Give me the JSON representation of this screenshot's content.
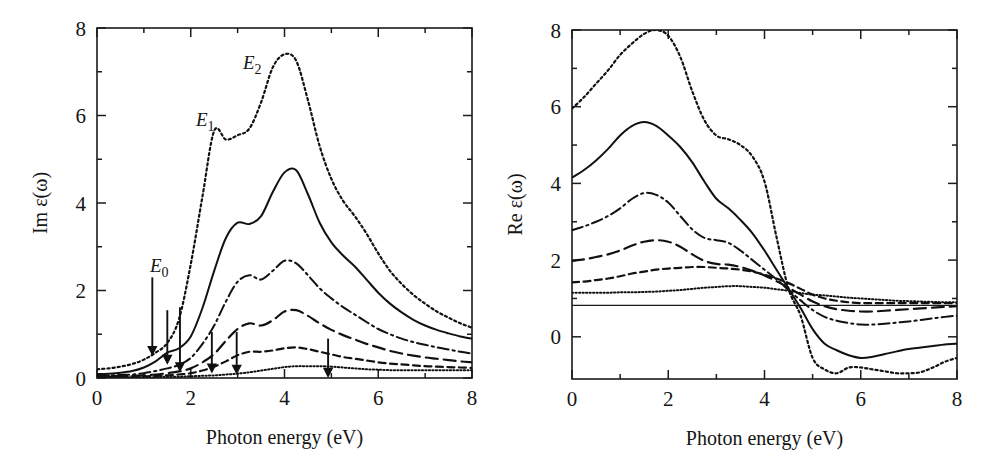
{
  "figure": {
    "panels": [
      {
        "id": "left",
        "ylabel": "Im ε(ω)",
        "xlabel": "Photon energy (eV)",
        "xticks": [
          "0",
          "2",
          "4",
          "6",
          "8"
        ],
        "yticks": [
          "0",
          "2",
          "4",
          "6",
          "8"
        ],
        "annotations": [
          {
            "name": "E0",
            "base": "E",
            "sub": "0",
            "x": 150,
            "y": 272
          },
          {
            "name": "E1",
            "base": "E",
            "sub": "1",
            "x": 196,
            "y": 126
          },
          {
            "name": "E2",
            "base": "E",
            "sub": "2",
            "x": 243,
            "y": 69
          }
        ]
      },
      {
        "id": "right",
        "ylabel": "Re ε(ω)",
        "xlabel": "Photon energy (eV)",
        "xticks": [
          "0",
          "2",
          "4",
          "6",
          "8"
        ],
        "yticks": [
          "0",
          "2",
          "4",
          "6",
          "8"
        ]
      }
    ]
  },
  "chart_data": [
    {
      "type": "line",
      "id": "imaginary-dielectric-function",
      "title": "",
      "xlabel": "Photon energy (eV)",
      "ylabel": "Im ε(ω)",
      "xlim": [
        0,
        8
      ],
      "ylim": [
        0,
        8
      ],
      "xticks": [
        0,
        2,
        4,
        6,
        8
      ],
      "yticks": [
        0,
        2,
        4,
        6,
        8
      ],
      "minor_xticks": [
        1,
        3,
        5,
        7
      ],
      "minor_yticks": [
        1,
        3,
        5,
        7
      ],
      "grid": false,
      "legend": "none",
      "annotations": [
        {
          "label": "E0",
          "text": "E₀"
        },
        {
          "label": "E1",
          "text": "E₁"
        },
        {
          "label": "E2",
          "text": "E₂"
        }
      ],
      "arrows": [
        {
          "x": 1.18,
          "y_top": 2.3,
          "y_tip": 0.55,
          "label": "E0"
        },
        {
          "x": 1.5,
          "y_top": 1.55,
          "y_tip": 0.35,
          "label": ""
        },
        {
          "x": 1.77,
          "y_top": 1.62,
          "y_tip": 0.18,
          "label": ""
        },
        {
          "x": 2.45,
          "y_top": 1.05,
          "y_tip": 0.15,
          "label": ""
        },
        {
          "x": 2.98,
          "y_top": 1.05,
          "y_tip": 0.12,
          "label": ""
        },
        {
          "x": 4.93,
          "y_top": 0.9,
          "y_tip": 0.05,
          "label": ""
        }
      ],
      "x": [
        0.0,
        0.25,
        0.5,
        0.75,
        1.0,
        1.25,
        1.5,
        1.75,
        2.0,
        2.25,
        2.5,
        2.75,
        3.0,
        3.25,
        3.5,
        3.75,
        4.0,
        4.25,
        4.5,
        4.75,
        5.0,
        5.25,
        5.5,
        5.75,
        6.0,
        6.25,
        6.5,
        6.75,
        7.0,
        7.25,
        7.5,
        7.75,
        8.0
      ],
      "series": [
        {
          "name": "curve-1-dotted-coarse",
          "style": "dotted",
          "values": [
            0.2,
            0.22,
            0.26,
            0.32,
            0.42,
            0.58,
            0.8,
            1.35,
            2.6,
            4.15,
            5.65,
            5.45,
            5.55,
            5.7,
            6.3,
            7.1,
            7.4,
            7.25,
            6.35,
            5.3,
            4.55,
            4.05,
            3.7,
            3.3,
            2.85,
            2.45,
            2.15,
            1.9,
            1.7,
            1.52,
            1.38,
            1.25,
            1.15
          ]
        },
        {
          "name": "curve-2-solid",
          "style": "solid",
          "values": [
            0.09,
            0.1,
            0.12,
            0.16,
            0.24,
            0.38,
            0.58,
            0.68,
            0.95,
            1.6,
            2.45,
            3.2,
            3.55,
            3.52,
            3.7,
            4.25,
            4.7,
            4.75,
            4.2,
            3.55,
            3.1,
            2.8,
            2.55,
            2.25,
            1.95,
            1.7,
            1.5,
            1.33,
            1.2,
            1.1,
            1.02,
            0.95,
            0.9
          ]
        },
        {
          "name": "curve-3-dash-dot",
          "style": "dash-dot",
          "values": [
            0.06,
            0.06,
            0.07,
            0.08,
            0.11,
            0.16,
            0.22,
            0.3,
            0.46,
            0.78,
            1.2,
            1.75,
            2.2,
            2.35,
            2.25,
            2.45,
            2.68,
            2.62,
            2.35,
            2.05,
            1.82,
            1.62,
            1.45,
            1.28,
            1.12,
            1.0,
            0.9,
            0.82,
            0.76,
            0.7,
            0.65,
            0.6,
            0.56
          ]
        },
        {
          "name": "curve-4-long-dash",
          "style": "long-dash",
          "values": [
            0.04,
            0.04,
            0.05,
            0.05,
            0.06,
            0.08,
            0.11,
            0.15,
            0.22,
            0.36,
            0.55,
            0.85,
            1.12,
            1.25,
            1.2,
            1.32,
            1.52,
            1.55,
            1.42,
            1.25,
            1.1,
            0.98,
            0.88,
            0.78,
            0.7,
            0.62,
            0.56,
            0.51,
            0.47,
            0.44,
            0.41,
            0.38,
            0.36
          ]
        },
        {
          "name": "curve-5-dash",
          "style": "dash",
          "values": [
            0.03,
            0.03,
            0.03,
            0.04,
            0.04,
            0.05,
            0.06,
            0.08,
            0.11,
            0.17,
            0.26,
            0.38,
            0.52,
            0.6,
            0.6,
            0.63,
            0.68,
            0.7,
            0.66,
            0.6,
            0.54,
            0.48,
            0.44,
            0.4,
            0.36,
            0.33,
            0.31,
            0.29,
            0.27,
            0.26,
            0.25,
            0.24,
            0.23
          ]
        },
        {
          "name": "curve-6-fine-dotted",
          "style": "fine-dotted",
          "values": [
            0.02,
            0.02,
            0.02,
            0.02,
            0.02,
            0.02,
            0.03,
            0.03,
            0.04,
            0.05,
            0.06,
            0.08,
            0.1,
            0.13,
            0.17,
            0.21,
            0.25,
            0.27,
            0.27,
            0.27,
            0.26,
            0.24,
            0.22,
            0.2,
            0.19,
            0.18,
            0.18,
            0.18,
            0.18,
            0.18,
            0.18,
            0.18,
            0.18
          ]
        }
      ]
    },
    {
      "type": "line",
      "id": "real-dielectric-function",
      "title": "",
      "xlabel": "Photon energy (eV)",
      "ylabel": "Re ε(ω)",
      "xlim": [
        0,
        8
      ],
      "ylim": [
        -1.1,
        8
      ],
      "xticks": [
        0,
        2,
        4,
        6,
        8
      ],
      "yticks": [
        0,
        2,
        4,
        6,
        8
      ],
      "minor_xticks": [
        1,
        3,
        5,
        7
      ],
      "minor_yticks": [
        1,
        3,
        5,
        7
      ],
      "grid": false,
      "legend": "none",
      "reference_line_y": 0.82,
      "x": [
        0.0,
        0.25,
        0.5,
        0.75,
        1.0,
        1.25,
        1.5,
        1.75,
        2.0,
        2.25,
        2.5,
        2.75,
        3.0,
        3.25,
        3.5,
        3.75,
        4.0,
        4.25,
        4.5,
        4.75,
        5.0,
        5.25,
        5.5,
        5.75,
        6.0,
        6.25,
        6.5,
        6.75,
        7.0,
        7.25,
        7.5,
        7.75,
        8.0
      ],
      "series": [
        {
          "name": "curve-1-dotted-coarse",
          "style": "dotted",
          "values": [
            5.95,
            6.25,
            6.6,
            6.95,
            7.35,
            7.65,
            7.9,
            8.0,
            7.85,
            7.3,
            6.4,
            5.65,
            5.25,
            5.15,
            5.0,
            4.7,
            4.05,
            2.6,
            1.25,
            0.55,
            -0.55,
            -0.85,
            -0.95,
            -0.8,
            -0.8,
            -0.85,
            -0.9,
            -0.95,
            -0.95,
            -0.92,
            -0.8,
            -0.65,
            -0.55
          ]
        },
        {
          "name": "curve-2-solid",
          "style": "solid",
          "values": [
            4.15,
            4.35,
            4.6,
            4.9,
            5.25,
            5.5,
            5.6,
            5.5,
            5.25,
            4.95,
            4.55,
            4.05,
            3.6,
            3.35,
            3.05,
            2.7,
            2.25,
            1.75,
            1.25,
            0.75,
            0.2,
            -0.18,
            -0.35,
            -0.48,
            -0.55,
            -0.52,
            -0.45,
            -0.38,
            -0.32,
            -0.28,
            -0.24,
            -0.2,
            -0.18
          ]
        },
        {
          "name": "curve-3-dash-dot",
          "style": "dash-dot",
          "values": [
            2.78,
            2.88,
            3.0,
            3.15,
            3.35,
            3.6,
            3.75,
            3.7,
            3.5,
            3.15,
            2.8,
            2.58,
            2.52,
            2.45,
            2.25,
            2.0,
            1.75,
            1.5,
            1.22,
            0.95,
            0.7,
            0.52,
            0.42,
            0.36,
            0.32,
            0.32,
            0.34,
            0.37,
            0.4,
            0.44,
            0.48,
            0.52,
            0.55
          ]
        },
        {
          "name": "curve-4-long-dash",
          "style": "long-dash",
          "values": [
            1.98,
            2.02,
            2.08,
            2.15,
            2.25,
            2.38,
            2.48,
            2.52,
            2.48,
            2.35,
            2.15,
            1.98,
            1.9,
            1.88,
            1.82,
            1.72,
            1.6,
            1.45,
            1.28,
            1.1,
            0.92,
            0.8,
            0.72,
            0.68,
            0.66,
            0.66,
            0.68,
            0.7,
            0.72,
            0.74,
            0.76,
            0.78,
            0.8
          ]
        },
        {
          "name": "curve-5-dash",
          "style": "dash",
          "values": [
            1.42,
            1.44,
            1.48,
            1.52,
            1.58,
            1.65,
            1.7,
            1.75,
            1.78,
            1.8,
            1.82,
            1.82,
            1.8,
            1.78,
            1.75,
            1.7,
            1.62,
            1.52,
            1.4,
            1.25,
            1.1,
            1.0,
            0.94,
            0.9,
            0.88,
            0.88,
            0.88,
            0.88,
            0.88,
            0.88,
            0.88,
            0.88,
            0.88
          ]
        },
        {
          "name": "curve-6-fine-dotted",
          "style": "fine-dotted",
          "values": [
            1.15,
            1.15,
            1.15,
            1.15,
            1.16,
            1.16,
            1.17,
            1.18,
            1.2,
            1.22,
            1.25,
            1.28,
            1.3,
            1.32,
            1.32,
            1.3,
            1.28,
            1.24,
            1.2,
            1.14,
            1.1,
            1.08,
            1.05,
            1.02,
            1.0,
            0.98,
            0.96,
            0.94,
            0.93,
            0.92,
            0.91,
            0.9,
            0.9
          ]
        }
      ]
    }
  ]
}
